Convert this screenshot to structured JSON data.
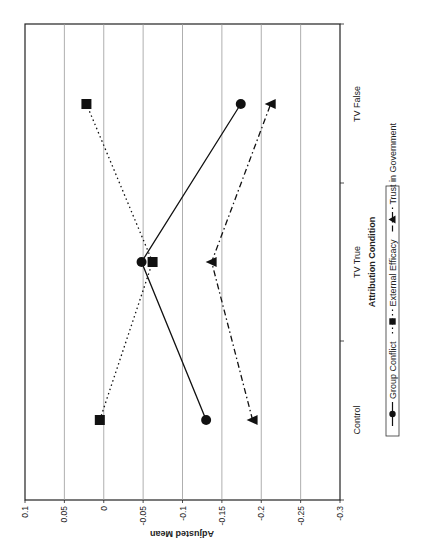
{
  "chart_data": {
    "type": "line",
    "orientation": "rotated-90-ccw",
    "title": "",
    "xlabel": "Attribution Condition",
    "ylabel": "Adjusted Mean",
    "categories": [
      "Control",
      "TV True",
      "TV False"
    ],
    "ylim": [
      -0.3,
      0.1
    ],
    "yticks": [
      0.1,
      0.05,
      0,
      -0.05,
      -0.1,
      -0.15,
      -0.2,
      -0.25,
      -0.3
    ],
    "ytick_labels": [
      "0.1",
      "0.05",
      "0",
      "-0.05",
      "-0.1",
      "-0.15",
      "-0.2",
      "-0.25",
      "-0.3"
    ],
    "grid": true,
    "legend_position": "bottom",
    "series": [
      {
        "name": "Group Conflict",
        "marker": "circle",
        "line": "solid",
        "values": [
          -0.13,
          -0.048,
          -0.174
        ]
      },
      {
        "name": "External Efficacy",
        "marker": "square",
        "line": "dotted",
        "values": [
          0.005,
          -0.062,
          0.022
        ]
      },
      {
        "name": "Trust in Government",
        "marker": "triangle",
        "line": "dash-dot",
        "values": [
          -0.189,
          -0.137,
          -0.212
        ]
      }
    ]
  },
  "colors": {
    "frame": "#222222",
    "grid": "#9a9a9a",
    "series": "#111111",
    "background": "#ffffff"
  }
}
